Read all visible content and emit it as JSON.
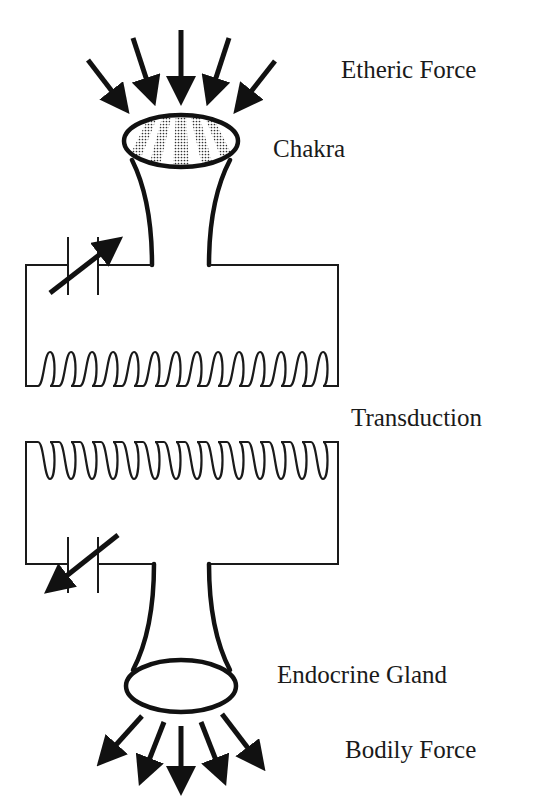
{
  "diagram": {
    "labels": {
      "etheric_force": "Etheric Force",
      "chakra": "Chakra",
      "transduction": "Transduction",
      "endocrine_gland": "Endocrine Gland",
      "bodily_force": "Bodily Force"
    },
    "colors": {
      "ink": "#111111",
      "background": "#ffffff"
    },
    "components": {
      "incoming_arrows": 5,
      "outgoing_arrows": 5,
      "upper_coil_loops": 14,
      "lower_coil_loops": 14,
      "variable_capacitors": 2
    }
  }
}
